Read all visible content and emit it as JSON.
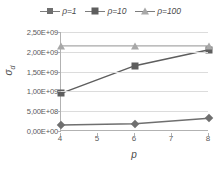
{
  "chart_data": {
    "type": "line",
    "title": "",
    "xlabel": "p",
    "ylabel": "σd",
    "ylabel_base": "σ",
    "ylabel_sub": "d",
    "x": [
      4,
      6,
      8
    ],
    "xlim": [
      4,
      8
    ],
    "ylim": [
      0,
      2500000000
    ],
    "grid": true,
    "legend_position": "top-center",
    "x_tick_labels": [
      "4",
      "5",
      "6",
      "7",
      "8"
    ],
    "x_tick_values": [
      4,
      5,
      6,
      7,
      8
    ],
    "y_tick_labels": [
      "0,00E+00",
      "5,00E+08",
      "1,00E+09",
      "1,50E+09",
      "2,00E+09",
      "2,50E+09"
    ],
    "y_tick_values": [
      0,
      500000000,
      1000000000,
      1500000000,
      2000000000,
      2500000000
    ],
    "series": [
      {
        "name": "ρ=1",
        "marker": "diamond",
        "color": "#6f6f6f",
        "values": [
          150000000,
          180000000,
          320000000
        ]
      },
      {
        "name": "ρ=10",
        "marker": "square",
        "color": "#5e5e5e",
        "values": [
          950000000,
          1650000000,
          2050000000
        ]
      },
      {
        "name": "ρ=100",
        "marker": "triangle",
        "color": "#a8a8a8",
        "values": [
          2150000000,
          2150000000,
          2150000000
        ]
      }
    ]
  },
  "legend": {
    "entries": [
      {
        "label": "ρ=1"
      },
      {
        "label": "ρ=10"
      },
      {
        "label": "ρ=100"
      }
    ]
  },
  "colors": {
    "axis": "#b2b2b2",
    "grid": "#dcdcdc",
    "text": "#5a5a5a",
    "series_1": "#6f6f6f",
    "series_2": "#5e5e5e",
    "series_3": "#a8a8a8",
    "background": "#ffffff"
  }
}
